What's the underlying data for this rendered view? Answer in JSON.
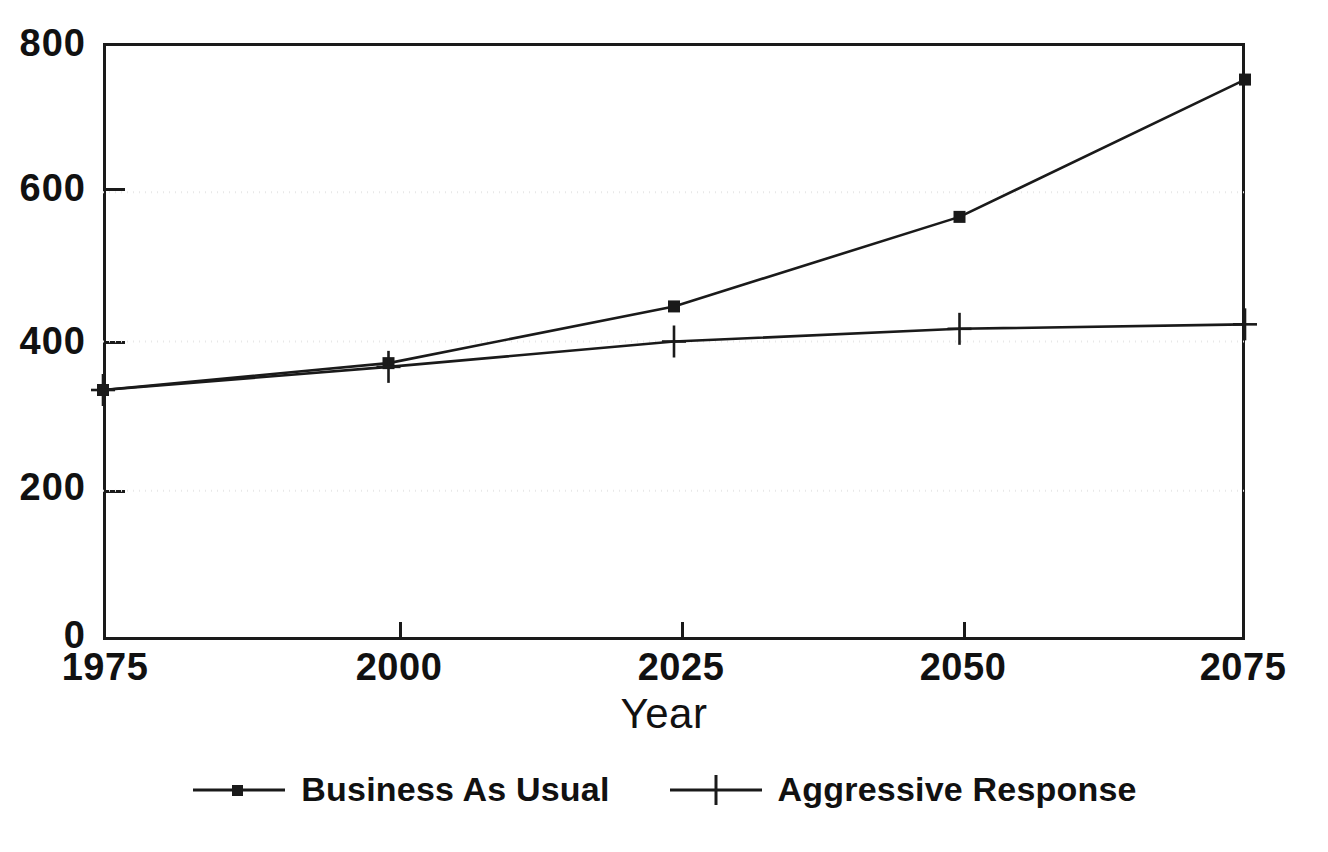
{
  "chart_data": {
    "type": "line",
    "title": "",
    "subtitle": "",
    "xlabel": "Year",
    "ylabel": "",
    "x": [
      1975,
      2000,
      2025,
      2050,
      2075
    ],
    "xlim": [
      1975,
      2075
    ],
    "ylim": [
      0,
      800
    ],
    "xticks": [
      "1975",
      "2000",
      "2025",
      "2050",
      "2075"
    ],
    "yticks": [
      "0",
      "200",
      "400",
      "600",
      "800"
    ],
    "ytick_values": [
      0,
      200,
      400,
      600,
      800
    ],
    "grid": "horizontal-dotted-faint",
    "legend_position": "below-center",
    "series": [
      {
        "name": "Business As Usual",
        "marker": "square-dot",
        "values": [
          335,
          371,
          447,
          567,
          751
        ]
      },
      {
        "name": "Aggressive Response",
        "marker": "plus",
        "values": [
          335,
          366,
          400,
          417,
          423
        ]
      }
    ],
    "annotations": [],
    "colors": {
      "line": "#1a1a1a",
      "axis": "#1a1a1a",
      "grid": "#e8e8e8",
      "background": "#ffffff",
      "text": "#111111"
    }
  },
  "axes": {
    "x_title": "Year",
    "x_tick_labels": [
      "1975",
      "2000",
      "2025",
      "2050",
      "2075"
    ],
    "y_tick_labels": [
      "0",
      "200",
      "400",
      "600",
      "800"
    ]
  },
  "legend": {
    "entries": [
      {
        "label": "Business As Usual",
        "marker": "square-dot"
      },
      {
        "label": "Aggressive Response",
        "marker": "plus"
      }
    ]
  }
}
